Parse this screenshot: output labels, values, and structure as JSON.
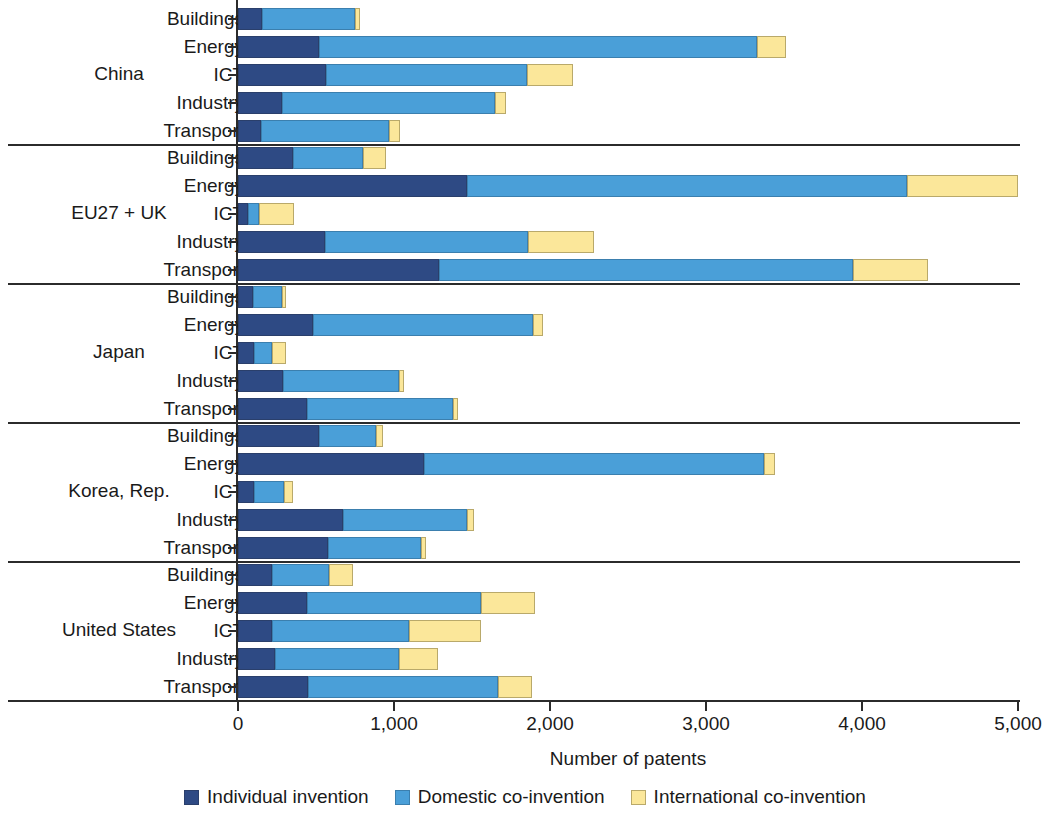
{
  "chart_data": {
    "type": "bar",
    "orientation": "horizontal",
    "stacked": true,
    "title": "",
    "xlabel": "Number of patents",
    "ylabel": "",
    "xlim": [
      0,
      5000
    ],
    "xticks": [
      0,
      1000,
      2000,
      3000,
      4000,
      5000
    ],
    "xtick_labels": [
      "0",
      "1,000",
      "2,000",
      "3,000",
      "4,000",
      "5,000"
    ],
    "grid": false,
    "legend_position": "bottom",
    "series": [
      {
        "name": "Individual invention",
        "color": "#2e4a84"
      },
      {
        "name": "Domestic co-invention",
        "color": "#4a9fd8"
      },
      {
        "name": "International co-invention",
        "color": "#fbe79a"
      }
    ],
    "categories": [
      "Buildings",
      "Energy",
      "ICT",
      "Industry",
      "Transport"
    ],
    "groups": [
      {
        "label": "China",
        "rows": [
          {
            "category": "Buildings",
            "values": [
              155,
              595,
              35
            ],
            "total": 785
          },
          {
            "category": "Energy",
            "values": [
              520,
              2805,
              190
            ],
            "total": 3515
          },
          {
            "category": "ICT",
            "values": [
              565,
              1285,
              295
            ],
            "total": 2145
          },
          {
            "category": "Industry",
            "values": [
              280,
              1370,
              65
            ],
            "total": 1715
          },
          {
            "category": "Transport",
            "values": [
              150,
              820,
              70
            ],
            "total": 1040
          }
        ]
      },
      {
        "label": "EU27 + UK",
        "rows": [
          {
            "category": "Buildings",
            "values": [
              350,
              450,
              150
            ],
            "total": 950
          },
          {
            "category": "Energy",
            "values": [
              1470,
              2820,
              710
            ],
            "total": 5000
          },
          {
            "category": "ICT",
            "values": [
              65,
              70,
              225
            ],
            "total": 360
          },
          {
            "category": "Industry",
            "values": [
              560,
              1300,
              420
            ],
            "total": 2280
          },
          {
            "category": "Transport",
            "values": [
              1290,
              2650,
              480
            ],
            "total": 4420
          }
        ]
      },
      {
        "label": "Japan",
        "rows": [
          {
            "category": "Buildings",
            "values": [
              95,
              190,
              20
            ],
            "total": 305
          },
          {
            "category": "Energy",
            "values": [
              480,
              1410,
              65
            ],
            "total": 1955
          },
          {
            "category": "ICT",
            "values": [
              105,
              115,
              90
            ],
            "total": 310
          },
          {
            "category": "Industry",
            "values": [
              290,
              740,
              35
            ],
            "total": 1065
          },
          {
            "category": "Transport",
            "values": [
              445,
              935,
              30
            ],
            "total": 1410
          }
        ]
      },
      {
        "label": "Korea, Rep.",
        "rows": [
          {
            "category": "Buildings",
            "values": [
              520,
              365,
              45
            ],
            "total": 930
          },
          {
            "category": "Energy",
            "values": [
              1190,
              2180,
              75
            ],
            "total": 3445
          },
          {
            "category": "ICT",
            "values": [
              105,
              190,
              55
            ],
            "total": 350
          },
          {
            "category": "Industry",
            "values": [
              670,
              800,
              45
            ],
            "total": 1515
          },
          {
            "category": "Transport",
            "values": [
              575,
              595,
              35
            ],
            "total": 1205
          }
        ]
      },
      {
        "label": "United States",
        "rows": [
          {
            "category": "Buildings",
            "values": [
              220,
              365,
              155
            ],
            "total": 740
          },
          {
            "category": "Energy",
            "values": [
              445,
              1110,
              350
            ],
            "total": 1905
          },
          {
            "category": "ICT",
            "values": [
              215,
              880,
              465
            ],
            "total": 1560
          },
          {
            "category": "Industry",
            "values": [
              235,
              795,
              255
            ],
            "total": 1285
          },
          {
            "category": "Transport",
            "values": [
              450,
              1215,
              220
            ],
            "total": 1885
          }
        ]
      }
    ]
  },
  "axis": {
    "x_title": "Number of patents",
    "tick_labels": [
      "0",
      "1,000",
      "2,000",
      "3,000",
      "4,000",
      "5,000"
    ]
  },
  "legend": {
    "items": [
      {
        "label": "Individual invention",
        "color": "#2e4a84"
      },
      {
        "label": "Domestic co-invention",
        "color": "#4a9fd8"
      },
      {
        "label": "International co-invention",
        "color": "#fbe79a"
      }
    ]
  },
  "groups": [
    {
      "label": "China"
    },
    {
      "label": "EU27 + UK"
    },
    {
      "label": "Japan"
    },
    {
      "label": "Korea, Rep."
    },
    {
      "label": "United States"
    }
  ]
}
